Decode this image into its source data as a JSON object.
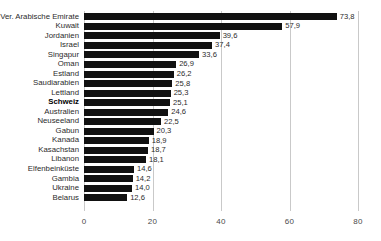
{
  "chart_data": {
    "type": "bar",
    "orientation": "horizontal",
    "title": "",
    "subtitle": "",
    "xlabel": "",
    "ylabel": "",
    "xlim": [
      0,
      80
    ],
    "xticks": [
      "0",
      "20",
      "40",
      "60",
      "80"
    ],
    "xtick_values": [
      0,
      20,
      40,
      60,
      80
    ],
    "grid": true,
    "legend": false,
    "decimal_separator": ",",
    "bar_color": "#111111",
    "grid_color": "#c9c9c9",
    "background_color": "#ffffff",
    "highlight_category": "Schweiz",
    "categories": [
      "Ver. Arabische Emirate",
      "Kuwait",
      "Jordanien",
      "Israel",
      "Singapur",
      "Oman",
      "Estland",
      "Saudiarabien",
      "Lettland",
      "Schweiz",
      "Australien",
      "Neuseeland",
      "Gabun",
      "Kanada",
      "Kasachstan",
      "Libanon",
      "Elfenbeinküste",
      "Gambia",
      "Ukraine",
      "Belarus"
    ],
    "values": [
      73.8,
      57.9,
      39.6,
      37.4,
      33.6,
      26.9,
      26.2,
      25.8,
      25.3,
      25.1,
      24.6,
      22.5,
      20.3,
      18.9,
      18.7,
      18.1,
      14.6,
      14.2,
      14.0,
      12.6
    ],
    "value_labels": [
      "73,8",
      "57,9",
      "39,6",
      "37,4",
      "33,6",
      "26,9",
      "26,2",
      "25,8",
      "25,3",
      "25,1",
      "24,6",
      "22,5",
      "20,3",
      "18,9",
      "18,7",
      "18,1",
      "14,6",
      "14,2",
      "14,0",
      "12,6"
    ]
  }
}
